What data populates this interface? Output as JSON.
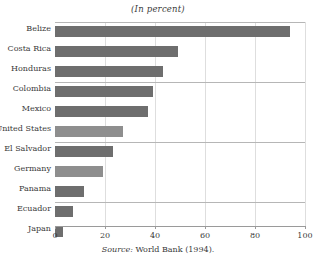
{
  "chart_data": {
    "type": "bar",
    "orientation": "horizontal",
    "title": "(In percent)",
    "xlabel": "",
    "ylabel": "",
    "xlim": [
      0,
      100
    ],
    "xticks": [
      0,
      20,
      40,
      60,
      80,
      100
    ],
    "xticklabels": [
      "0",
      "20",
      "40",
      "60",
      "80",
      "100"
    ],
    "grid": "vertical",
    "legend": "none",
    "categories": [
      "Belize",
      "Costa Rica",
      "Honduras",
      "Colombia",
      "Mexico",
      "United States",
      "El Salvador",
      "Germany",
      "Panama",
      "Ecuador",
      "Japan"
    ],
    "values": [
      94,
      49,
      43,
      39,
      37,
      27,
      23,
      19,
      11.5,
      7,
      3
    ],
    "bar_shades": [
      "dark",
      "dark",
      "dark",
      "dark",
      "dark",
      "light",
      "dark",
      "light",
      "dark",
      "dark",
      "dark"
    ],
    "group_separator_after": [
      "Honduras",
      "United States",
      "Panama"
    ],
    "colors": {
      "bar_dark": "#6e6e6e",
      "bar_light": "#8e8e8e",
      "gridline": "#d8d8d8",
      "rule": "#b6b6b6",
      "axis": "#9a9a9a",
      "text": "#3a3a3a"
    }
  },
  "source": {
    "prefix": "Source:",
    "text": " World Bank (1994)."
  }
}
